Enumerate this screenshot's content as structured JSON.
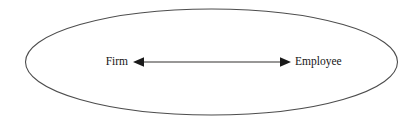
{
  "diagram": {
    "type": "relationship-diagram",
    "background_color": "#ffffff",
    "boundary": {
      "shape": "ellipse",
      "stroke_color": "#4d4d4d",
      "fill": "none",
      "center_x": 211.5,
      "center_y": 62,
      "radius_x": 186,
      "radius_y": 53
    },
    "nodes": [
      {
        "id": "firm",
        "label": "Firm",
        "side": "left",
        "x": 128,
        "y": 62
      },
      {
        "id": "employee",
        "label": "Employee",
        "side": "right",
        "x": 295,
        "y": 62
      }
    ],
    "connector": {
      "id": "firm-employee-connector",
      "style": "double-headed-arrow",
      "direction": "bidirectional",
      "color": "#1a1a1a",
      "y": 62,
      "x_start": 133,
      "x_end": 291,
      "head_length": 11,
      "head_half_height": 4.5
    }
  }
}
